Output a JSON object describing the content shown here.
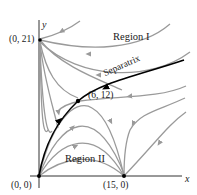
{
  "diagram": {
    "type": "phase_portrait",
    "axes": {
      "x_label": "x",
      "y_label": "y"
    },
    "equilibria": [
      {
        "label": "(0, 0)",
        "x": 0,
        "y": 0
      },
      {
        "label": "(0, 21)",
        "x": 0,
        "y": 21
      },
      {
        "label": "(15, 0)",
        "x": 15,
        "y": 0
      },
      {
        "label": "(6, 12)",
        "x": 6,
        "y": 12
      }
    ],
    "regions": [
      {
        "label": "Region I"
      },
      {
        "label": "Region II"
      }
    ],
    "separatrix_label": "Separatrix",
    "colors": {
      "trajectory": "#9a9a9a",
      "separatrix": "#000000",
      "axis": "#333333",
      "text": "#1a1a1a"
    }
  }
}
